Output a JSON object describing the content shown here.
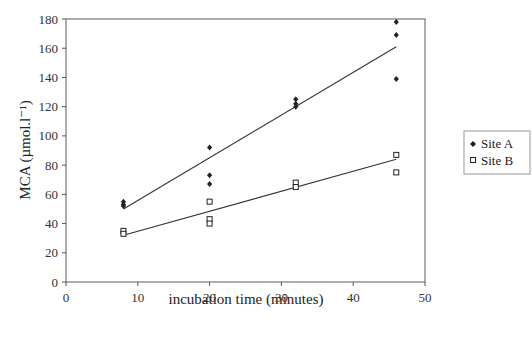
{
  "chart_data": {
    "type": "scatter",
    "title": "",
    "xlabel": "incubation time (minutes)",
    "ylabel": "MCA (µmol.l⁻¹)",
    "xlim": [
      0,
      50
    ],
    "ylim": [
      0,
      180
    ],
    "xticks": [
      0,
      10,
      20,
      30,
      40,
      50
    ],
    "yticks": [
      0,
      20,
      40,
      60,
      80,
      100,
      120,
      140,
      160,
      180
    ],
    "grid": false,
    "legend_position": "right",
    "series": [
      {
        "name": "Site A",
        "marker": "filled-diamond",
        "color": "#222222",
        "points": [
          [
            8,
            55
          ],
          [
            8,
            53
          ],
          [
            8,
            52
          ],
          [
            20,
            92
          ],
          [
            20,
            73
          ],
          [
            20,
            67
          ],
          [
            32,
            125
          ],
          [
            32,
            122
          ],
          [
            32,
            120
          ],
          [
            46,
            178
          ],
          [
            46,
            169
          ],
          [
            46,
            139
          ]
        ],
        "trendline": {
          "x": [
            8,
            46
          ],
          "y": [
            50,
            161
          ]
        }
      },
      {
        "name": "Site B",
        "marker": "open-square",
        "color": "#222222",
        "points": [
          [
            8,
            35
          ],
          [
            8,
            33
          ],
          [
            20,
            55
          ],
          [
            20,
            43
          ],
          [
            20,
            40
          ],
          [
            32,
            68
          ],
          [
            32,
            65
          ],
          [
            46,
            87
          ],
          [
            46,
            75
          ]
        ],
        "trendline": {
          "x": [
            8,
            46
          ],
          "y": [
            32,
            84
          ]
        }
      }
    ]
  },
  "legend": {
    "items": [
      {
        "label": "Site A",
        "marker": "filled-diamond"
      },
      {
        "label": "Site B",
        "marker": "open-square"
      }
    ]
  },
  "colors": {
    "axis": "#555555",
    "frame": "#777777",
    "marker": "#222222",
    "trendline": "#333333"
  }
}
